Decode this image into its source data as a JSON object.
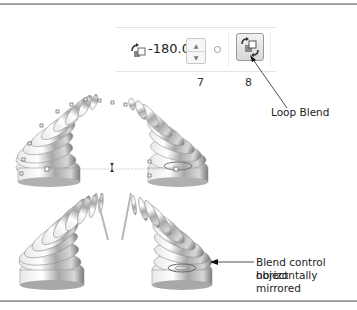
{
  "toolbar": {
    "rotation_value": "-180.0",
    "spinner_up": "▲",
    "spinner_down": "▼",
    "labels": [
      "7",
      "8"
    ],
    "loop_blend_button": "loop-blend"
  },
  "callouts": {
    "loop_blend": "Loop Blend",
    "control_object_line1": "Blend control object",
    "control_object_line2": "horizontally mirrored"
  },
  "colors": {
    "rule": "#8a8a8a",
    "metal_light": "#f4f4f4",
    "metal_mid": "#c0c0c0",
    "metal_dark": "#7c7c7c"
  }
}
